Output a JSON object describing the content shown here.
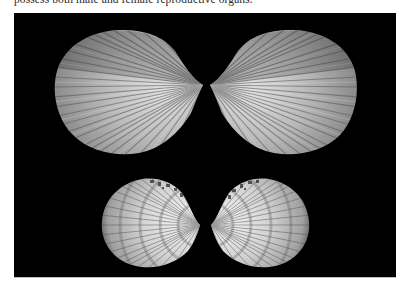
{
  "caption": {
    "text": "possess both male and female reproductive organs."
  },
  "figure": {
    "background_color": "#000000",
    "shells": [
      {
        "id": "top-left-valve",
        "label": "Large valve, exterior, hinge facing right",
        "color_light": "#d8d8d8",
        "color_dark": "#6e6e6e"
      },
      {
        "id": "top-right-valve",
        "label": "Large valve, exterior, hinge facing left",
        "color_light": "#d8d8d8",
        "color_dark": "#6e6e6e"
      },
      {
        "id": "bottom-left-valve",
        "label": "Small valve, exterior, banded, hinge facing right",
        "color_light": "#efefef",
        "color_dark": "#7a7a7a"
      },
      {
        "id": "bottom-right-valve",
        "label": "Small valve, exterior, banded, hinge facing left",
        "color_light": "#efefef",
        "color_dark": "#7a7a7a"
      }
    ]
  }
}
